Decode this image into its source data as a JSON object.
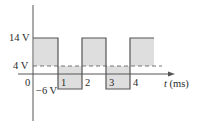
{
  "diagram": {
    "type": "square-wave",
    "y_labels": {
      "high": "14 V",
      "average": "4 V",
      "origin": "0",
      "low": "−6 V"
    },
    "x_axis": {
      "var": "t",
      "unit": "(ms)"
    },
    "x_ticks": [
      "1",
      "2",
      "3",
      "4"
    ],
    "levels": {
      "high": 14,
      "average": 4,
      "low": -6
    },
    "colors": {
      "fill": "#dedede",
      "line": "#555555",
      "text": "#2a2a2a"
    }
  }
}
